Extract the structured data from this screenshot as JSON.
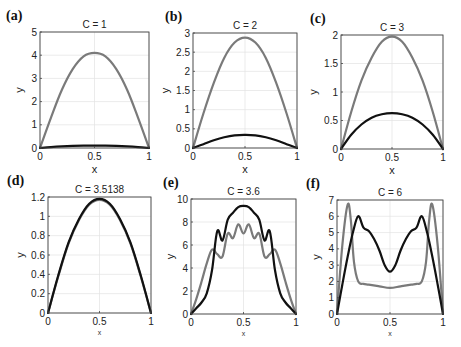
{
  "chart_data": [
    {
      "panel": "(a)",
      "type": "line",
      "title": "C = 1",
      "xlabel": "x",
      "ylabel": "y",
      "xlim": [
        0,
        1
      ],
      "ylim": [
        0,
        5
      ],
      "xticks": [
        0,
        0.5,
        1
      ],
      "xtick_labels": [
        "0",
        "0.5",
        "1"
      ],
      "yticks": [
        0,
        1,
        2,
        3,
        4,
        5
      ],
      "ytick_labels": [
        "0",
        "1",
        "2",
        "3",
        "4",
        "5"
      ],
      "grid": true,
      "box": {
        "x0": 40,
        "y0": 32,
        "x1": 149,
        "y1": 148
      },
      "series": [
        {
          "name": "gray",
          "color": "#7a7a7a",
          "x": [
            0,
            0.1,
            0.2,
            0.3,
            0.4,
            0.5,
            0.6,
            0.7,
            0.8,
            0.9,
            1
          ],
          "y": [
            0,
            1.3,
            2.5,
            3.4,
            3.95,
            4.1,
            3.95,
            3.4,
            2.5,
            1.3,
            0
          ]
        },
        {
          "name": "black",
          "color": "#111111",
          "x": [
            0,
            0.1,
            0.2,
            0.3,
            0.4,
            0.5,
            0.6,
            0.7,
            0.8,
            0.9,
            1
          ],
          "y": [
            0,
            0.04,
            0.07,
            0.09,
            0.1,
            0.1,
            0.1,
            0.09,
            0.07,
            0.04,
            0
          ]
        }
      ]
    },
    {
      "panel": "(b)",
      "type": "line",
      "title": "C = 2",
      "xlabel": "x",
      "ylabel": "y",
      "xlim": [
        0,
        1
      ],
      "ylim": [
        0,
        3
      ],
      "xticks": [
        0,
        0.5,
        1
      ],
      "xtick_labels": [
        "0",
        "0.5",
        "1"
      ],
      "yticks": [
        0,
        0.5,
        1,
        1.5,
        2,
        2.5,
        3
      ],
      "ytick_labels": [
        "0",
        "0.5",
        "1",
        "1.5",
        "2",
        "2.5",
        "3"
      ],
      "grid": true,
      "box": {
        "x0": 193,
        "y0": 33,
        "x1": 297,
        "y1": 148
      },
      "series": [
        {
          "name": "gray",
          "color": "#7a7a7a",
          "x": [
            0,
            0.1,
            0.2,
            0.3,
            0.4,
            0.5,
            0.6,
            0.7,
            0.8,
            0.9,
            1
          ],
          "y": [
            0,
            0.9,
            1.7,
            2.35,
            2.75,
            2.88,
            2.75,
            2.35,
            1.7,
            0.9,
            0
          ]
        },
        {
          "name": "black",
          "color": "#111111",
          "x": [
            0,
            0.1,
            0.2,
            0.3,
            0.4,
            0.5,
            0.6,
            0.7,
            0.8,
            0.9,
            1
          ],
          "y": [
            0,
            0.1,
            0.2,
            0.28,
            0.33,
            0.34,
            0.33,
            0.28,
            0.2,
            0.1,
            0
          ]
        }
      ]
    },
    {
      "panel": "(c)",
      "type": "line",
      "title": "C = 3",
      "xlabel": "x",
      "ylabel": "y",
      "xlim": [
        0,
        1
      ],
      "ylim": [
        0,
        2
      ],
      "xticks": [
        0,
        0.5,
        1
      ],
      "xtick_labels": [
        "0",
        "0.5",
        "1"
      ],
      "yticks": [
        0,
        0.5,
        1,
        1.5,
        2
      ],
      "ytick_labels": [
        "0",
        "0.5",
        "1",
        "1.5",
        "2"
      ],
      "grid": true,
      "box": {
        "x0": 341,
        "y0": 35,
        "x1": 443,
        "y1": 149
      },
      "series": [
        {
          "name": "gray",
          "color": "#7a7a7a",
          "x": [
            0,
            0.1,
            0.2,
            0.3,
            0.4,
            0.5,
            0.6,
            0.7,
            0.8,
            0.9,
            1
          ],
          "y": [
            0,
            0.65,
            1.2,
            1.6,
            1.88,
            1.97,
            1.88,
            1.6,
            1.2,
            0.65,
            0
          ]
        },
        {
          "name": "black",
          "color": "#111111",
          "x": [
            0,
            0.1,
            0.2,
            0.3,
            0.4,
            0.5,
            0.6,
            0.7,
            0.8,
            0.9,
            1
          ],
          "y": [
            0,
            0.25,
            0.43,
            0.55,
            0.61,
            0.63,
            0.61,
            0.55,
            0.43,
            0.25,
            0
          ]
        }
      ]
    },
    {
      "panel": "(d)",
      "type": "line",
      "title": "C = 3.5138",
      "xlabel": "x",
      "ylabel": "y",
      "xlim": [
        0,
        1
      ],
      "ylim": [
        0,
        1.2
      ],
      "xticks": [
        0,
        0.5,
        1
      ],
      "xtick_labels": [
        "0",
        "0.5",
        "1"
      ],
      "yticks": [
        0,
        0.2,
        0.4,
        0.6,
        0.8,
        1,
        1.2
      ],
      "ytick_labels": [
        "0",
        "0.2",
        "0.4",
        "0.6",
        "0.8",
        "1",
        "1.2"
      ],
      "grid": true,
      "box": {
        "x0": 48,
        "y0": 197,
        "x1": 151,
        "y1": 313
      },
      "series": [
        {
          "name": "gray",
          "color": "#7a7a7a",
          "x": [
            0,
            0.1,
            0.2,
            0.3,
            0.4,
            0.5,
            0.6,
            0.7,
            0.8,
            0.9,
            1
          ],
          "y": [
            0,
            0.38,
            0.72,
            0.96,
            1.12,
            1.17,
            1.12,
            0.96,
            0.72,
            0.38,
            0
          ]
        },
        {
          "name": "black",
          "color": "#111111",
          "x": [
            0,
            0.1,
            0.2,
            0.3,
            0.4,
            0.5,
            0.6,
            0.7,
            0.8,
            0.9,
            1
          ],
          "y": [
            0,
            0.39,
            0.73,
            0.97,
            1.13,
            1.18,
            1.13,
            0.97,
            0.73,
            0.39,
            0
          ]
        }
      ]
    },
    {
      "panel": "(e)",
      "type": "line",
      "title": "C = 3.6",
      "xlabel": "x",
      "ylabel": "y",
      "xlim": [
        0,
        1
      ],
      "ylim": [
        0,
        10
      ],
      "xticks": [
        0,
        0.5,
        1
      ],
      "xtick_labels": [
        "0",
        "0.5",
        "1"
      ],
      "yticks": [
        0,
        2,
        4,
        6,
        8,
        10
      ],
      "ytick_labels": [
        "0",
        "2",
        "4",
        "6",
        "8",
        "10"
      ],
      "grid": true,
      "box": {
        "x0": 191,
        "y0": 199,
        "x1": 296,
        "y1": 314
      },
      "series": [
        {
          "name": "gray",
          "color": "#7a7a7a",
          "x": [
            0,
            0.05,
            0.1,
            0.15,
            0.2,
            0.25,
            0.3,
            0.35,
            0.4,
            0.45,
            0.5,
            0.55,
            0.6,
            0.65,
            0.7,
            0.75,
            0.8,
            0.85,
            0.9,
            0.95,
            1
          ],
          "y": [
            0,
            1.3,
            2.8,
            4.4,
            5.6,
            5.2,
            5.0,
            7.0,
            6.6,
            7.8,
            7.0,
            7.8,
            6.6,
            7.0,
            5.0,
            5.2,
            5.6,
            4.4,
            2.8,
            1.3,
            0
          ]
        },
        {
          "name": "black",
          "color": "#111111",
          "x": [
            0,
            0.05,
            0.1,
            0.15,
            0.2,
            0.25,
            0.3,
            0.35,
            0.4,
            0.45,
            0.5,
            0.55,
            0.6,
            0.65,
            0.7,
            0.75,
            0.8,
            0.85,
            0.9,
            0.95,
            1
          ],
          "y": [
            0,
            0.5,
            1.0,
            1.8,
            3.8,
            7.2,
            6.4,
            8.2,
            8.8,
            9.3,
            9.4,
            9.3,
            8.8,
            8.2,
            6.4,
            7.2,
            3.8,
            1.8,
            1.0,
            0.5,
            0
          ]
        }
      ]
    },
    {
      "panel": "(f)",
      "type": "line",
      "title": "C = 6",
      "xlabel": "x",
      "ylabel": "y",
      "xlim": [
        0,
        1
      ],
      "ylim": [
        0,
        7
      ],
      "xticks": [
        0,
        0.5,
        1
      ],
      "xtick_labels": [
        "0",
        "0.5",
        "1"
      ],
      "yticks": [
        0,
        1,
        2,
        3,
        4,
        5,
        6,
        7
      ],
      "ytick_labels": [
        "0",
        "1",
        "2",
        "3",
        "4",
        "5",
        "6",
        "7"
      ],
      "grid": true,
      "box": {
        "x0": 337,
        "y0": 200,
        "x1": 443,
        "y1": 314
      },
      "series": [
        {
          "name": "gray",
          "color": "#7a7a7a",
          "x": [
            0,
            0.05,
            0.1,
            0.13,
            0.16,
            0.2,
            0.25,
            0.3,
            0.4,
            0.5,
            0.6,
            0.7,
            0.75,
            0.8,
            0.84,
            0.87,
            0.9,
            0.95,
            1
          ],
          "y": [
            0,
            4.2,
            6.7,
            5.8,
            3.2,
            2.0,
            1.85,
            1.8,
            1.7,
            1.6,
            1.7,
            1.8,
            1.85,
            2.0,
            3.2,
            5.8,
            6.7,
            4.2,
            0
          ]
        },
        {
          "name": "black",
          "color": "#111111",
          "x": [
            0,
            0.05,
            0.1,
            0.15,
            0.2,
            0.25,
            0.3,
            0.35,
            0.4,
            0.45,
            0.5,
            0.55,
            0.6,
            0.65,
            0.7,
            0.75,
            0.8,
            0.85,
            0.9,
            0.95,
            1
          ],
          "y": [
            0,
            1.8,
            3.5,
            5.0,
            6.0,
            5.3,
            5.1,
            4.6,
            3.9,
            3.0,
            2.6,
            3.0,
            3.9,
            4.6,
            5.1,
            5.3,
            6.0,
            5.0,
            3.5,
            1.8,
            0
          ]
        }
      ]
    }
  ]
}
